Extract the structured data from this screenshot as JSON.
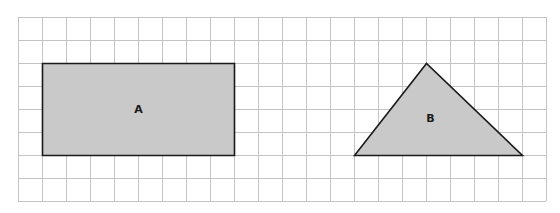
{
  "grid": {
    "origin_x": 18,
    "origin_y": 17,
    "cols": 22,
    "rows": 8,
    "cell_w": 24,
    "cell_h": 23,
    "line_color": "#c4c4c4",
    "border_color": "#bdbdbd"
  },
  "shapes": [
    {
      "id": "A",
      "type": "rectangle",
      "label": "A",
      "grid_points": [
        [
          1,
          2
        ],
        [
          9,
          2
        ],
        [
          9,
          6
        ],
        [
          1,
          6
        ]
      ],
      "width_units": 8,
      "height_units": 4,
      "fill": "#c9c9c9",
      "stroke": "#1a1a1a"
    },
    {
      "id": "B",
      "type": "triangle",
      "label": "B",
      "grid_points": [
        [
          14,
          6
        ],
        [
          17,
          2
        ],
        [
          21,
          6
        ]
      ],
      "base_units": 7,
      "height_units": 4,
      "fill": "#c9c9c9",
      "stroke": "#1a1a1a"
    }
  ]
}
